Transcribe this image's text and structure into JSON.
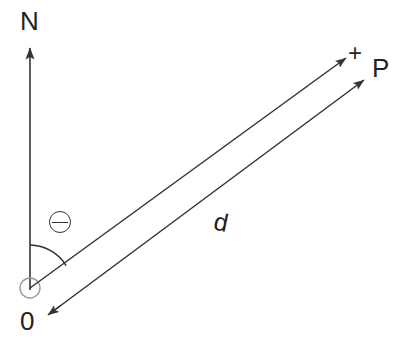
{
  "diagram": {
    "stroke_color": "#333333",
    "background_color": "#ffffff",
    "origin_circle_color": "#8a8a8a",
    "labels": {
      "north": "N",
      "origin": "0",
      "point": "P",
      "plus": "+",
      "distance": "d",
      "angle": "⊖"
    },
    "icons": {
      "angle_symbol": "theta-circle-icon",
      "origin_marker": "origin-circle-icon",
      "north_arrow": "north-arrow-icon",
      "bearing_arrow": "bearing-arrow-icon",
      "distance_arrow": "distance-arrow-icon"
    },
    "geometry": {
      "origin": {
        "x": 30,
        "y": 288
      },
      "north_arrow_tip": {
        "x": 30,
        "y": 44
      },
      "north_arrow_tail": {
        "x": 30,
        "y": 290
      },
      "bearing_ray_tip": {
        "x": 350,
        "y": 55
      },
      "distance_line_start": {
        "x": 47,
        "y": 316
      },
      "distance_line_tip": {
        "x": 368,
        "y": 77
      },
      "arc_radius": 43,
      "arc_start_angle_deg": 0,
      "arc_end_angle_deg": 57,
      "bearing_angle_deg": 57,
      "origin_circle_radius": 10
    }
  }
}
